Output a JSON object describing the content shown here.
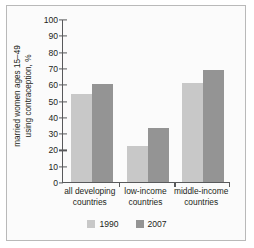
{
  "chart_data": {
    "type": "bar",
    "title": "",
    "subtitle": "",
    "xlabel": "",
    "ylabel_line1": "married women ages 15–49",
    "ylabel_line2": "using contraception, %",
    "categories": [
      {
        "line1": "all developing",
        "line2": "countries"
      },
      {
        "line1": "low-income",
        "line2": "countries"
      },
      {
        "line1": "middle-income",
        "line2": "countries"
      }
    ],
    "series": [
      {
        "name": "1990",
        "color": "#c8c8c8",
        "values": [
          54,
          22,
          61
        ]
      },
      {
        "name": "2007",
        "color": "#949494",
        "values": [
          60,
          33,
          69
        ]
      }
    ],
    "ylim": [
      0,
      100
    ],
    "ytick_step": 10,
    "yticks": [
      0,
      10,
      20,
      30,
      40,
      50,
      60,
      70,
      80,
      90,
      100
    ],
    "ytick_labels": [
      "0",
      "10",
      "20",
      "30",
      "40",
      "50",
      "60",
      "70",
      "80",
      "90",
      "100"
    ],
    "grid": false,
    "legend_position": "bottom-center"
  },
  "legend": {
    "items": [
      {
        "label": "1990"
      },
      {
        "label": "2007"
      }
    ]
  },
  "colors": {
    "series_1990": "#c8c8c8",
    "series_2007": "#949494",
    "axis": "#58595b",
    "text": "#231f20",
    "frame_border": "#b9b9b9",
    "background": "#fbfbfb"
  }
}
